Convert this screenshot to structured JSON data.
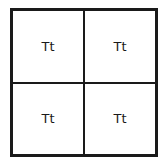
{
  "punnett_square": {
    "rows": 2,
    "columns": 2,
    "cells": [
      {
        "label": "Tt"
      },
      {
        "label": "Tt"
      },
      {
        "label": "Tt"
      },
      {
        "label": "Tt"
      }
    ]
  }
}
